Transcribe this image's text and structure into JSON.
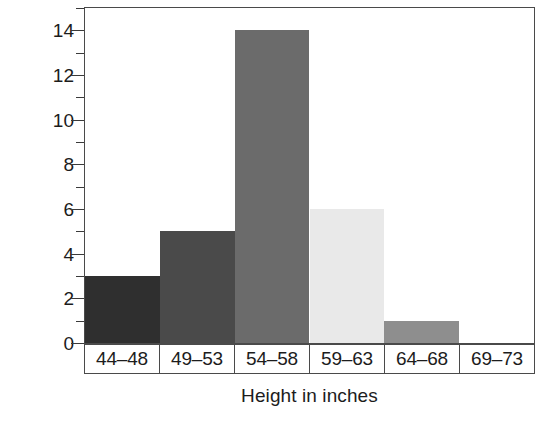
{
  "chart_data": {
    "type": "bar",
    "title": "",
    "xlabel": "Height in inches",
    "ylabel": "Number of students",
    "categories": [
      "44–48",
      "49–53",
      "54–58",
      "59–63",
      "64–68",
      "69–73"
    ],
    "values": [
      3,
      5,
      14,
      6,
      1,
      0
    ],
    "ylim": [
      0,
      15
    ],
    "y_ticks_major": [
      0,
      2,
      4,
      6,
      8,
      10,
      12,
      14
    ],
    "y_tick_labels": [
      "0",
      "2",
      "4",
      "6",
      "8",
      "10",
      "12",
      "14"
    ],
    "y_ticks_minor": [
      1,
      3,
      5,
      7,
      9,
      11,
      13,
      15
    ],
    "grid": false,
    "legend": false,
    "bar_colors": [
      "#2f2f2f",
      "#4a4a4a",
      "#6b6b6b",
      "#e9e9e9",
      "#8e8e8e",
      "#ffffff"
    ],
    "axis_color": "#4a4a4a",
    "text_color": "#1c1c1c",
    "background": "#ffffff"
  }
}
